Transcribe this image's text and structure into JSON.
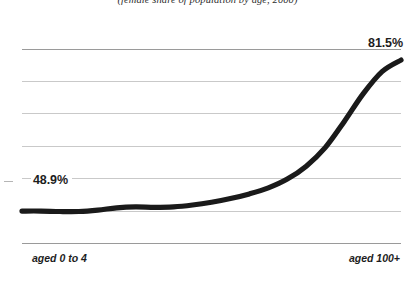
{
  "chart_data": {
    "type": "line",
    "title": "(female share of population by age, 2000)",
    "xlabel": "",
    "ylabel": "",
    "grid": true,
    "legend": "none",
    "categories": [
      "aged 0 to 4",
      "aged 5 to 9",
      "aged 10 to 14",
      "aged 15 to 19",
      "aged 20 to 24",
      "aged 25 to 29",
      "aged 30 to 34",
      "aged 35 to 39",
      "aged 40 to 44",
      "aged 45 to 49",
      "aged 50 to 54",
      "aged 55 to 59",
      "aged 60 to 64",
      "aged 65 to 69",
      "aged 70 to 74",
      "aged 75 to 79",
      "aged 80 to 84",
      "aged 85 to 89",
      "aged 90 to 94",
      "aged 95 to 99",
      "aged 100+"
    ],
    "values": [
      48.9,
      48.9,
      48.8,
      48.8,
      49.1,
      49.6,
      49.8,
      49.7,
      49.8,
      50.2,
      50.8,
      51.6,
      52.6,
      53.9,
      55.8,
      58.6,
      62.6,
      68.2,
      74.2,
      79.0,
      81.5
    ],
    "ylim": [
      42,
      88
    ],
    "yticks": [
      42,
      49,
      56,
      63,
      70,
      77,
      84
    ],
    "series_color": "#1a1a1a",
    "gridline_color": "#c9c9c9",
    "axis_color": "#9a9a9a",
    "annotations": [
      {
        "name": "start-value",
        "text": "48.9%",
        "category": "aged 0 to 4"
      },
      {
        "name": "end-value",
        "text": "81.5%",
        "category": "aged 100+"
      }
    ],
    "axis_labels": {
      "left": "aged 0 to 4",
      "right": "aged 100+"
    }
  }
}
